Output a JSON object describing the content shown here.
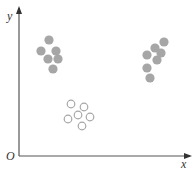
{
  "diagram": {
    "type": "scatter-clusters",
    "axes": {
      "x_label": "x",
      "y_label": "y",
      "origin_label": "O"
    },
    "colors": {
      "axis": "#555555",
      "filled_point": "#a6a6a6",
      "open_point": "#a6a6a6"
    },
    "clusters": [
      {
        "name": "top-left-filled",
        "style": "filled",
        "points": [
          [
            49,
            40
          ],
          [
            41,
            51
          ],
          [
            56,
            51
          ],
          [
            48,
            59
          ],
          [
            58,
            59
          ],
          [
            53,
            69
          ]
        ]
      },
      {
        "name": "top-right-filled",
        "style": "filled",
        "points": [
          [
            164,
            42
          ],
          [
            155,
            48
          ],
          [
            161,
            53
          ],
          [
            147,
            55
          ],
          [
            157,
            60
          ],
          [
            147,
            68
          ],
          [
            150,
            78
          ]
        ]
      },
      {
        "name": "bottom-middle-open",
        "style": "open",
        "points": [
          [
            71,
            104
          ],
          [
            84,
            107
          ],
          [
            78,
            115
          ],
          [
            90,
            117
          ],
          [
            68,
            119
          ],
          [
            82,
            126
          ]
        ]
      }
    ]
  }
}
